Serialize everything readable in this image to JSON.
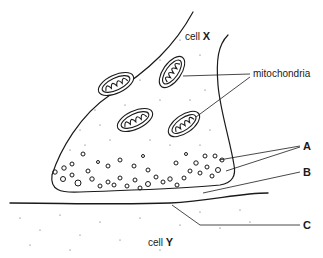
{
  "diagram": {
    "cells": [
      {
        "id": "X",
        "label_prefix": "cell",
        "label_letter": "X"
      },
      {
        "id": "Y",
        "label_prefix": "cell",
        "label_letter": "Y"
      }
    ],
    "labels": {
      "mitochondria": "mitochondria",
      "A": "A",
      "B": "B",
      "C": "C"
    },
    "colors": {
      "line": "#1a1a1a",
      "background": "#ffffff"
    }
  }
}
